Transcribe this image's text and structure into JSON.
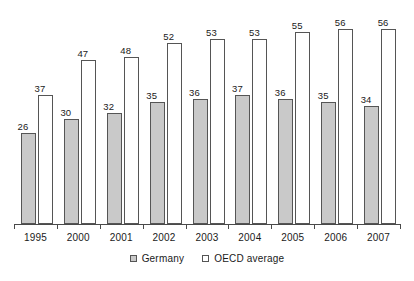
{
  "chart_data": {
    "type": "bar",
    "title": "",
    "subtitle": "",
    "xlabel": "",
    "ylabel": "",
    "ylim": [
      0,
      62
    ],
    "grid": false,
    "legend_position": "bottom-center",
    "categories": [
      "1995",
      "2000",
      "2001",
      "2002",
      "2003",
      "2004",
      "2005",
      "2006",
      "2007"
    ],
    "series": [
      {
        "name": "Germany",
        "color": "#c9c9c9",
        "values": [
          26,
          30,
          32,
          35,
          36,
          37,
          36,
          35,
          34
        ]
      },
      {
        "name": "OECD average",
        "color": "#ffffff",
        "values": [
          37,
          47,
          48,
          52,
          53,
          53,
          55,
          56,
          56
        ]
      }
    ]
  },
  "legend": {
    "items": [
      {
        "label": "Germany",
        "swatch": "gray-square-icon"
      },
      {
        "label": "OECD average",
        "swatch": "white-square-icon"
      }
    ]
  }
}
